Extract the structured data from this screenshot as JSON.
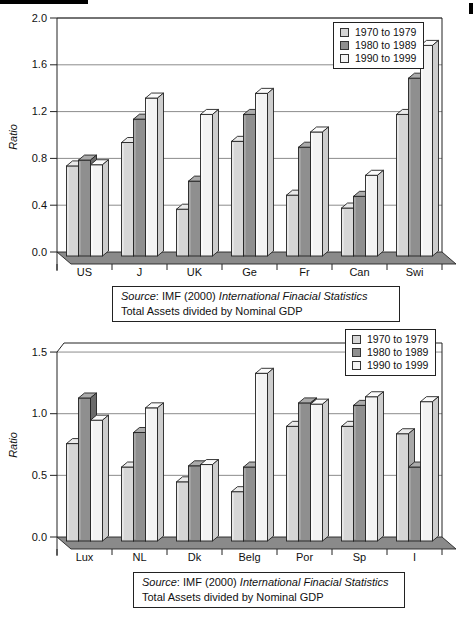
{
  "figure": {
    "background": "#ffffff"
  },
  "colors": {
    "series": [
      {
        "name": "1970 to 1979",
        "front": "#d6d6d6",
        "top": "#eaeaea",
        "side": "#a8a8a8"
      },
      {
        "name": "1980 to 1989",
        "front": "#8f8f8f",
        "top": "#ababab",
        "side": "#6a6a6a"
      },
      {
        "name": "1990 to 1999",
        "front": "#f3f3f3",
        "top": "#fbfbfb",
        "side": "#cdcdcd"
      }
    ],
    "floor": "#8a8a8a",
    "outline": "#222222",
    "grid": "#6f6f6f",
    "text": "#111111"
  },
  "chart_data": [
    {
      "type": "bar",
      "style": "3d-column",
      "title": "",
      "xlabel": "",
      "ylabel": "Ratio",
      "categories": [
        "US",
        "J",
        "UK",
        "Ge",
        "Fr",
        "Can",
        "Swi"
      ],
      "series": [
        {
          "name": "1970 to 1979",
          "values": [
            0.77,
            0.97,
            0.4,
            0.98,
            0.52,
            0.41,
            1.21
          ]
        },
        {
          "name": "1980 to 1989",
          "values": [
            0.82,
            1.17,
            0.64,
            1.21,
            0.93,
            0.51,
            1.52
          ]
        },
        {
          "name": "1990 to 1999",
          "values": [
            0.78,
            1.35,
            1.21,
            1.39,
            1.06,
            0.69,
            1.8
          ]
        }
      ],
      "ylim": [
        0.0,
        2.0
      ],
      "ytick_labels": [
        "0.0",
        "0.4",
        "0.8",
        "1.2",
        "1.6",
        "2.0"
      ],
      "ytick_values": [
        0.0,
        0.4,
        0.8,
        1.2,
        1.6,
        2.0
      ],
      "grid": true,
      "legend_position": "top-right",
      "caption": {
        "source_label": "Source",
        "source_rest": ": IMF (2000) ",
        "source_title": "International Finacial Statistics",
        "line2": "Total Assets divided by Nominal GDP"
      }
    },
    {
      "type": "bar",
      "style": "3d-column",
      "title": "",
      "xlabel": "",
      "ylabel": "Ratio",
      "categories": [
        "Lux",
        "NL",
        "Dk",
        "Belg",
        "Por",
        "Sp",
        "I"
      ],
      "series": [
        {
          "name": "1970 to 1979",
          "values": [
            0.79,
            0.6,
            0.48,
            0.4,
            0.93,
            0.93,
            0.87
          ]
        },
        {
          "name": "1980 to 1989",
          "values": [
            1.16,
            0.88,
            0.61,
            0.6,
            1.12,
            1.1,
            0.6
          ]
        },
        {
          "name": "1990 to 1999",
          "values": [
            0.98,
            1.08,
            0.62,
            1.36,
            1.11,
            1.17,
            1.13
          ]
        }
      ],
      "ylim": [
        0.0,
        1.5
      ],
      "ytick_labels": [
        "0.0",
        "0.5",
        "1.0",
        "1.5"
      ],
      "ytick_values": [
        0.0,
        0.5,
        1.0,
        1.5
      ],
      "grid": true,
      "legend_position": "top-right",
      "caption": {
        "source_label": "Source",
        "source_rest": ": IMF (2000) ",
        "source_title": "International Finacial Statistics",
        "line2": "Total Assets divided by Nominal GDP"
      }
    }
  ]
}
